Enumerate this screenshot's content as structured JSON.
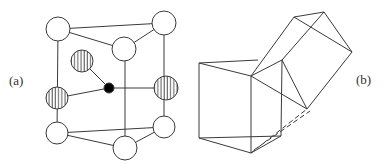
{
  "figure": {
    "labels": {
      "a": "(a)",
      "b": "(b)"
    },
    "panel_a": {
      "description": "unit cell with open, striped and filled atoms",
      "atom_types": [
        "open-circle",
        "striped-circle",
        "filled-dot"
      ]
    },
    "panel_b": {
      "description": "wireframe of two adjoined polyhedra (cube-like prisms)"
    },
    "colors": {
      "line": "#3a3a3a",
      "fill_open": "#ffffff",
      "fill_dot": "#000000"
    }
  }
}
